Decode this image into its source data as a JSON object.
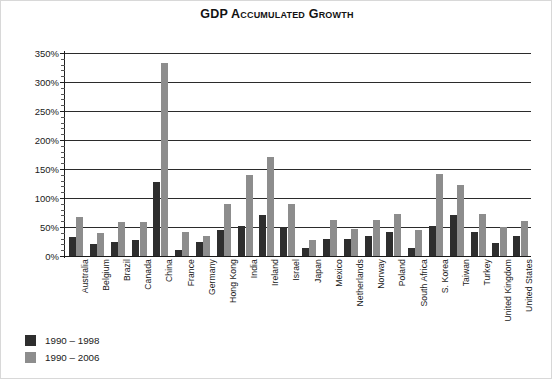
{
  "chart_data": {
    "type": "bar",
    "title": "GDP Accumulated Growth",
    "xlabel": "",
    "ylabel": "",
    "ylim": [
      0,
      350
    ],
    "ytick_values": [
      0,
      50,
      100,
      150,
      200,
      250,
      300,
      350
    ],
    "ytick_labels": [
      "0%",
      "50%",
      "100%",
      "150%",
      "200%",
      "250%",
      "300%",
      "350%"
    ],
    "minor_tick_interval": 10,
    "grid": true,
    "grid_axis": "y",
    "legend_position": "below-left",
    "categories": [
      "Australia",
      "Belgium",
      "Brazil",
      "Canada",
      "China",
      "France",
      "Germany",
      "Hong Kong",
      "India",
      "Ireland",
      "Israel",
      "Japan",
      "Mexico",
      "Netherlands",
      "Norway",
      "Poland",
      "South Africa",
      "S. Korea",
      "Taiwan",
      "Turkey",
      "United Kingdom",
      "United States"
    ],
    "series": [
      {
        "name": "1990 – 1998",
        "color": "#2e2e2e",
        "values": [
          32,
          20,
          25,
          28,
          128,
          10,
          24,
          45,
          52,
          70,
          50,
          13,
          30,
          30,
          35,
          42,
          13,
          52,
          70,
          42,
          22,
          35
        ]
      },
      {
        "name": "1990 – 2006",
        "color": "#8d8d8d",
        "values": [
          68,
          40,
          58,
          58,
          332,
          42,
          35,
          90,
          140,
          170,
          90,
          28,
          62,
          47,
          62,
          72,
          45,
          142,
          122,
          72,
          50,
          60
        ]
      }
    ]
  },
  "legend": {
    "items": [
      {
        "label": "1990 – 1998"
      },
      {
        "label": "1990 – 2006"
      }
    ]
  }
}
